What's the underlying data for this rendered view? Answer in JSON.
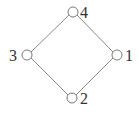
{
  "diagram": {
    "type": "hasse-diagram",
    "nodes": [
      {
        "id": "4",
        "label": "4",
        "x": 73,
        "y": 12,
        "lx": 80,
        "ly": 18
      },
      {
        "id": "3",
        "label": "3",
        "x": 27,
        "y": 55,
        "lx": 9,
        "ly": 61
      },
      {
        "id": "1",
        "label": "1",
        "x": 117,
        "y": 55,
        "lx": 125,
        "ly": 61
      },
      {
        "id": "2",
        "label": "2",
        "x": 72,
        "y": 98,
        "lx": 80,
        "ly": 104
      }
    ],
    "edges": [
      {
        "from": "4",
        "to": "3"
      },
      {
        "from": "4",
        "to": "1"
      },
      {
        "from": "3",
        "to": "2"
      },
      {
        "from": "1",
        "to": "2"
      }
    ]
  }
}
